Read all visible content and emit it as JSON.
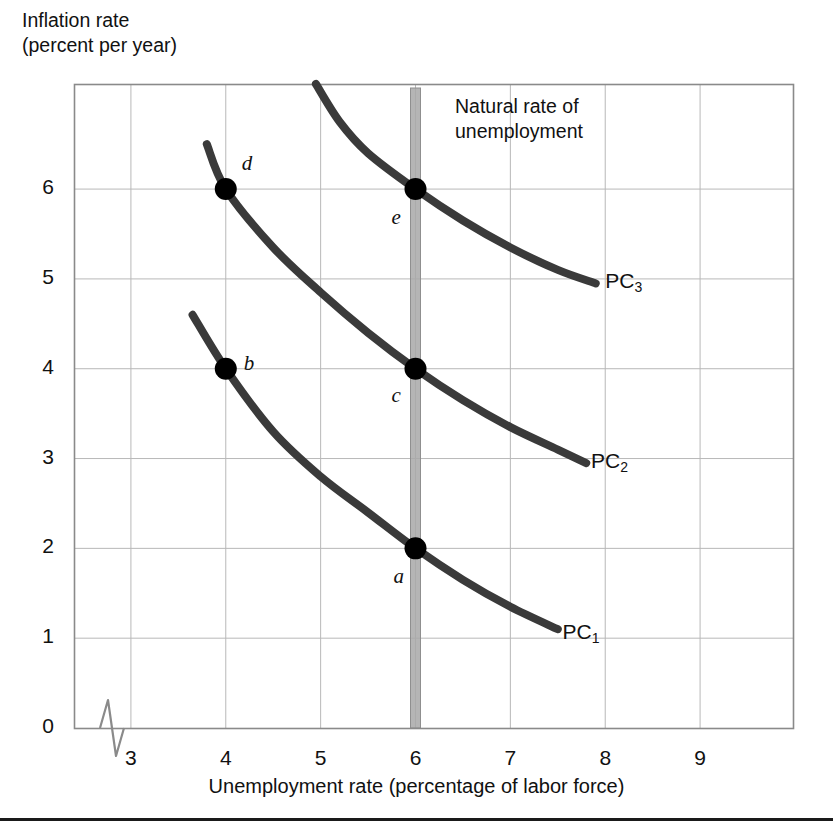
{
  "chart_data": {
    "type": "line",
    "title": "",
    "xlabel": "Unemployment rate (percentage of labor force)",
    "ylabel": "Inflation rate\n(percent per year)",
    "ylabel_line1": "Inflation rate",
    "ylabel_line2": "(percent per year)",
    "xlim": [
      2.4,
      9.99
    ],
    "ylim": [
      0,
      7.17
    ],
    "grid": true,
    "legend": "inline-curve-labels",
    "x_ticks": [
      "3",
      "4",
      "5",
      "6",
      "7",
      "8",
      "9"
    ],
    "x_tick_values": [
      3,
      4,
      5,
      6,
      7,
      8,
      9
    ],
    "y_ticks": [
      "0",
      "1",
      "2",
      "3",
      "4",
      "5",
      "6"
    ],
    "y_tick_values": [
      0,
      1,
      2,
      3,
      4,
      5,
      6
    ],
    "axis_break": true,
    "series": [
      {
        "name": "PC1",
        "label": "PC",
        "subscript": "1",
        "label_x": 7.55,
        "label_y": 1.05,
        "points": [
          [
            3.65,
            4.6
          ],
          [
            4.0,
            4.0
          ],
          [
            4.5,
            3.3
          ],
          [
            5.0,
            2.8
          ],
          [
            5.5,
            2.4
          ],
          [
            6.0,
            2.0
          ],
          [
            6.5,
            1.65
          ],
          [
            7.0,
            1.35
          ],
          [
            7.5,
            1.1
          ]
        ]
      },
      {
        "name": "PC2",
        "label": "PC",
        "subscript": "2",
        "label_x": 7.85,
        "label_y": 2.95,
        "points": [
          [
            3.8,
            6.5
          ],
          [
            4.0,
            6.0
          ],
          [
            4.5,
            5.35
          ],
          [
            5.0,
            4.85
          ],
          [
            5.5,
            4.4
          ],
          [
            6.0,
            4.0
          ],
          [
            6.5,
            3.65
          ],
          [
            7.0,
            3.35
          ],
          [
            7.5,
            3.1
          ],
          [
            7.8,
            2.95
          ]
        ]
      },
      {
        "name": "PC3",
        "label": "PC",
        "subscript": "3",
        "label_x": 8.0,
        "label_y": 4.95,
        "points": [
          [
            4.95,
            7.17
          ],
          [
            5.2,
            6.75
          ],
          [
            5.5,
            6.4
          ],
          [
            6.0,
            6.0
          ],
          [
            6.5,
            5.65
          ],
          [
            7.0,
            5.35
          ],
          [
            7.5,
            5.1
          ],
          [
            7.9,
            4.95
          ]
        ]
      }
    ],
    "annotated_points": [
      {
        "id": "a",
        "x": 6,
        "y": 2,
        "label": "a",
        "label_dx": -22,
        "label_dy": 30
      },
      {
        "id": "b",
        "x": 4,
        "y": 4,
        "label": "b",
        "label_dx": 18,
        "label_dy": -4
      },
      {
        "id": "c",
        "x": 6,
        "y": 4,
        "label": "c",
        "label_dx": -24,
        "label_dy": 28
      },
      {
        "id": "d",
        "x": 4,
        "y": 6,
        "label": "d",
        "label_dx": 16,
        "label_dy": -24
      },
      {
        "id": "e",
        "x": 6,
        "y": 6,
        "label": "e",
        "label_dx": -24,
        "label_dy": 30
      }
    ],
    "annotations": [
      {
        "name": "natural-rate-of-unemployment",
        "text_line1": "Natural rate of",
        "text_line2": "unemployment",
        "at_x": 6,
        "type": "vertical-band"
      }
    ],
    "colors": {
      "curve": "#3a3a3a",
      "point": "#000000",
      "grid": "#b8b8b8",
      "frame": "#8a8a8a",
      "natural_rate_band": "#a8a8a8",
      "text": "#111111",
      "background": "#ffffff"
    }
  }
}
